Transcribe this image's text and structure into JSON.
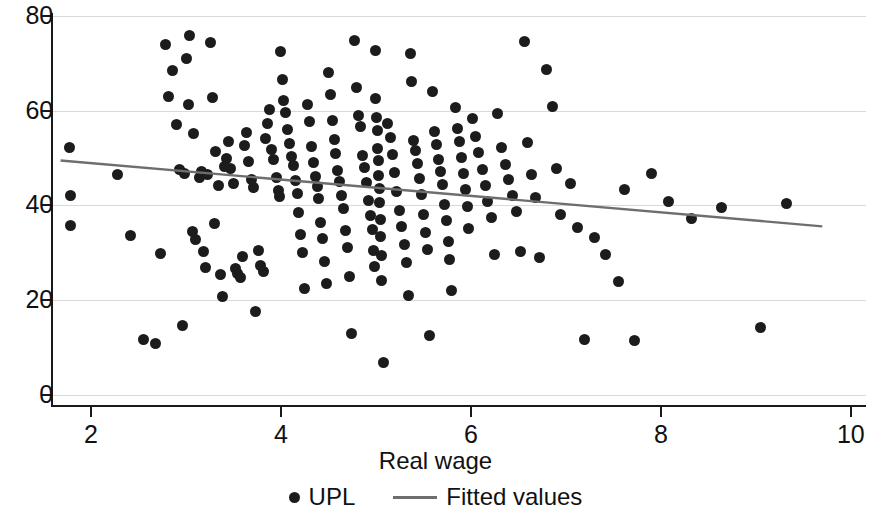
{
  "chart_data": {
    "type": "scatter",
    "title": "",
    "xlabel": "Real wage",
    "ylabel": "",
    "xlim": [
      1.59,
      10.16
    ],
    "ylim": [
      0,
      80.2
    ],
    "xticks": [
      2,
      4,
      6,
      8,
      10
    ],
    "yticks": [
      0,
      20,
      40,
      60,
      80
    ],
    "xtick_labels": [
      "2",
      "4",
      "6",
      "8",
      "10"
    ],
    "ytick_labels": [
      "0",
      "20",
      "40",
      "60",
      "80"
    ],
    "grid": "horizontal",
    "grid_color": "#d9d9d9",
    "marker_color": "#1c1c1c",
    "line_color": "#6e6e6e",
    "legend_position": "bottom",
    "series": [
      {
        "name": "UPL",
        "type": "scatter",
        "points": [
          [
            1.77,
            52.2
          ],
          [
            1.79,
            42.0
          ],
          [
            1.78,
            35.8
          ],
          [
            2.28,
            46.6
          ],
          [
            2.42,
            33.6
          ],
          [
            2.55,
            11.8
          ],
          [
            2.68,
            10.8
          ],
          [
            2.73,
            29.8
          ],
          [
            2.79,
            74.0
          ],
          [
            2.82,
            63.0
          ],
          [
            2.86,
            68.4
          ],
          [
            2.9,
            57.0
          ],
          [
            2.93,
            47.6
          ],
          [
            2.96,
            14.6
          ],
          [
            2.99,
            46.8
          ],
          [
            3.01,
            71.0
          ],
          [
            3.04,
            75.8
          ],
          [
            3.03,
            61.4
          ],
          [
            3.08,
            55.2
          ],
          [
            3.07,
            34.6
          ],
          [
            3.1,
            32.8
          ],
          [
            3.14,
            45.8
          ],
          [
            3.16,
            47.2
          ],
          [
            3.18,
            30.2
          ],
          [
            3.21,
            27.0
          ],
          [
            3.23,
            46.6
          ],
          [
            3.26,
            74.4
          ],
          [
            3.28,
            62.8
          ],
          [
            3.31,
            51.4
          ],
          [
            3.34,
            44.2
          ],
          [
            3.3,
            36.2
          ],
          [
            3.36,
            25.4
          ],
          [
            3.38,
            20.8
          ],
          [
            3.41,
            48.2
          ],
          [
            3.43,
            50.0
          ],
          [
            3.45,
            53.6
          ],
          [
            3.47,
            47.8
          ],
          [
            3.5,
            44.6
          ],
          [
            3.52,
            26.6
          ],
          [
            3.54,
            25.6
          ],
          [
            3.57,
            24.8
          ],
          [
            3.6,
            29.2
          ],
          [
            3.62,
            52.6
          ],
          [
            3.64,
            55.4
          ],
          [
            3.66,
            49.2
          ],
          [
            3.69,
            45.4
          ],
          [
            3.71,
            43.8
          ],
          [
            3.73,
            17.6
          ],
          [
            3.76,
            30.4
          ],
          [
            3.79,
            27.4
          ],
          [
            3.82,
            26.0
          ],
          [
            3.84,
            54.2
          ],
          [
            3.86,
            57.4
          ],
          [
            3.88,
            60.2
          ],
          [
            3.9,
            51.8
          ],
          [
            3.92,
            49.6
          ],
          [
            3.95,
            46.0
          ],
          [
            3.97,
            43.2
          ],
          [
            3.99,
            41.8
          ],
          [
            4.0,
            72.4
          ],
          [
            4.02,
            66.6
          ],
          [
            4.03,
            62.2
          ],
          [
            4.05,
            59.6
          ],
          [
            4.07,
            56.0
          ],
          [
            4.09,
            53.0
          ],
          [
            4.11,
            50.4
          ],
          [
            4.13,
            48.4
          ],
          [
            4.15,
            45.2
          ],
          [
            4.17,
            42.6
          ],
          [
            4.19,
            38.6
          ],
          [
            4.21,
            33.8
          ],
          [
            4.23,
            30.0
          ],
          [
            4.25,
            22.4
          ],
          [
            4.28,
            61.4
          ],
          [
            4.3,
            57.8
          ],
          [
            4.32,
            52.4
          ],
          [
            4.34,
            49.0
          ],
          [
            4.36,
            46.2
          ],
          [
            4.38,
            44.0
          ],
          [
            4.4,
            41.4
          ],
          [
            4.42,
            36.4
          ],
          [
            4.44,
            33.0
          ],
          [
            4.46,
            28.2
          ],
          [
            4.48,
            23.6
          ],
          [
            4.5,
            68.0
          ],
          [
            4.52,
            63.4
          ],
          [
            4.54,
            58.0
          ],
          [
            4.56,
            54.0
          ],
          [
            4.58,
            51.0
          ],
          [
            4.6,
            47.4
          ],
          [
            4.62,
            45.0
          ],
          [
            4.64,
            42.2
          ],
          [
            4.66,
            39.4
          ],
          [
            4.68,
            34.8
          ],
          [
            4.7,
            31.2
          ],
          [
            4.72,
            25.0
          ],
          [
            4.74,
            13.0
          ],
          [
            4.78,
            74.8
          ],
          [
            4.8,
            65.0
          ],
          [
            4.82,
            59.0
          ],
          [
            4.84,
            56.6
          ],
          [
            4.86,
            50.6
          ],
          [
            4.88,
            48.0
          ],
          [
            4.9,
            44.8
          ],
          [
            4.92,
            41.0
          ],
          [
            4.94,
            37.8
          ],
          [
            4.96,
            35.0
          ],
          [
            4.98,
            30.6
          ],
          [
            4.99,
            27.2
          ],
          [
            5.0,
            72.8
          ],
          [
            5.0,
            62.6
          ],
          [
            5.01,
            58.6
          ],
          [
            5.02,
            55.8
          ],
          [
            5.02,
            52.0
          ],
          [
            5.03,
            49.4
          ],
          [
            5.03,
            46.4
          ],
          [
            5.04,
            43.6
          ],
          [
            5.04,
            40.6
          ],
          [
            5.05,
            37.0
          ],
          [
            5.05,
            33.4
          ],
          [
            5.06,
            29.4
          ],
          [
            5.06,
            24.2
          ],
          [
            5.08,
            6.8
          ],
          [
            5.12,
            57.2
          ],
          [
            5.15,
            54.4
          ],
          [
            5.18,
            50.8
          ],
          [
            5.2,
            47.0
          ],
          [
            5.22,
            43.0
          ],
          [
            5.25,
            39.0
          ],
          [
            5.27,
            35.6
          ],
          [
            5.3,
            31.8
          ],
          [
            5.32,
            28.0
          ],
          [
            5.34,
            21.0
          ],
          [
            5.36,
            72.0
          ],
          [
            5.38,
            66.2
          ],
          [
            5.4,
            53.8
          ],
          [
            5.42,
            51.6
          ],
          [
            5.44,
            48.8
          ],
          [
            5.46,
            45.6
          ],
          [
            5.48,
            42.4
          ],
          [
            5.5,
            38.2
          ],
          [
            5.52,
            34.2
          ],
          [
            5.54,
            30.8
          ],
          [
            5.56,
            12.6
          ],
          [
            5.6,
            64.0
          ],
          [
            5.62,
            55.6
          ],
          [
            5.64,
            52.8
          ],
          [
            5.66,
            49.8
          ],
          [
            5.68,
            47.2
          ],
          [
            5.7,
            44.4
          ],
          [
            5.72,
            40.2
          ],
          [
            5.74,
            36.8
          ],
          [
            5.76,
            32.4
          ],
          [
            5.78,
            28.6
          ],
          [
            5.8,
            22.0
          ],
          [
            5.84,
            60.6
          ],
          [
            5.86,
            56.2
          ],
          [
            5.88,
            53.4
          ],
          [
            5.9,
            50.2
          ],
          [
            5.92,
            46.8
          ],
          [
            5.94,
            43.4
          ],
          [
            5.96,
            39.8
          ],
          [
            5.98,
            35.2
          ],
          [
            6.02,
            58.4
          ],
          [
            6.05,
            54.6
          ],
          [
            6.08,
            51.2
          ],
          [
            6.12,
            47.6
          ],
          [
            6.15,
            44.2
          ],
          [
            6.18,
            40.8
          ],
          [
            6.22,
            37.4
          ],
          [
            6.25,
            29.6
          ],
          [
            6.28,
            59.4
          ],
          [
            6.32,
            52.2
          ],
          [
            6.36,
            48.6
          ],
          [
            6.4,
            45.4
          ],
          [
            6.44,
            42.0
          ],
          [
            6.48,
            38.8
          ],
          [
            6.52,
            30.2
          ],
          [
            6.56,
            74.6
          ],
          [
            6.6,
            53.2
          ],
          [
            6.64,
            46.6
          ],
          [
            6.68,
            41.6
          ],
          [
            6.72,
            29.0
          ],
          [
            6.8,
            68.6
          ],
          [
            6.86,
            60.8
          ],
          [
            6.9,
            47.8
          ],
          [
            6.94,
            38.0
          ],
          [
            7.05,
            44.6
          ],
          [
            7.12,
            35.4
          ],
          [
            7.2,
            11.8
          ],
          [
            7.3,
            33.2
          ],
          [
            7.42,
            29.6
          ],
          [
            7.55,
            24.0
          ],
          [
            7.62,
            43.4
          ],
          [
            7.72,
            11.6
          ],
          [
            7.9,
            46.8
          ],
          [
            8.08,
            40.8
          ],
          [
            8.32,
            37.2
          ],
          [
            8.64,
            39.6
          ],
          [
            9.05,
            14.2
          ],
          [
            9.32,
            40.4
          ]
        ]
      },
      {
        "name": "Fitted values",
        "type": "line",
        "x": [
          1.68,
          9.7
        ],
        "y": [
          49.5,
          35.6
        ]
      }
    ],
    "legend": [
      {
        "label": "UPL",
        "marker": "dot"
      },
      {
        "label": "Fitted values",
        "marker": "line"
      }
    ]
  }
}
